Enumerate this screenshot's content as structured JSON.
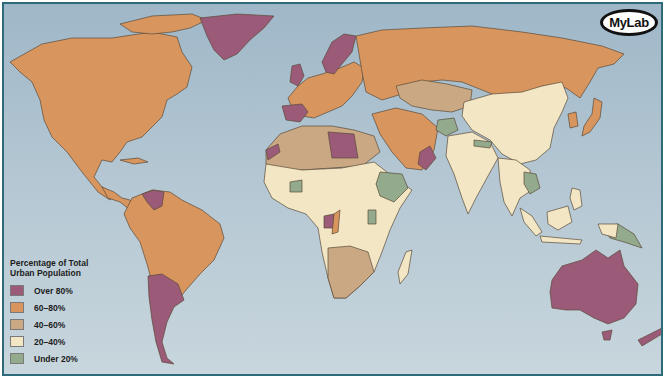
{
  "map": {
    "title": "Percentage of Total Urban Population",
    "logo_text": "MyLab",
    "colors": {
      "ocean": "#b0c4d0",
      "over_80": "#9a5a78",
      "from_60_to_80": "#d9955e",
      "from_40_to_60": "#c9a883",
      "from_20_to_40": "#f3e6c4",
      "under_20": "#93aa8c",
      "frame": "#2f6a78"
    },
    "legend": {
      "title_line1": "Percentage of Total",
      "title_line2": "Urban Population",
      "items": [
        {
          "label": "Over 80%",
          "color": "#9a5a78"
        },
        {
          "label": "60–80%",
          "color": "#d9955e"
        },
        {
          "label": "40–60%",
          "color": "#c9a883"
        },
        {
          "label": "20–40%",
          "color": "#f3e6c4"
        },
        {
          "label": "Under 20%",
          "color": "#93aa8c"
        }
      ]
    },
    "regions": [
      {
        "name": "North America",
        "category": "60–80%"
      },
      {
        "name": "Greenland",
        "category": "Over 80%"
      },
      {
        "name": "South America (most)",
        "category": "60–80%"
      },
      {
        "name": "Argentina / Chile / Uruguay",
        "category": "Over 80%"
      },
      {
        "name": "Venezuela",
        "category": "Over 80%"
      },
      {
        "name": "Russia",
        "category": "60–80%"
      },
      {
        "name": "Western Europe",
        "category": "60–80%"
      },
      {
        "name": "UK / Scandinavia / Spain / Benelux",
        "category": "Over 80%"
      },
      {
        "name": "Central Asia",
        "category": "40–60%"
      },
      {
        "name": "China",
        "category": "20–40%"
      },
      {
        "name": "South Asia",
        "category": "20–40%"
      },
      {
        "name": "Afghanistan / Nepal",
        "category": "Under 20%"
      },
      {
        "name": "Middle East",
        "category": "60–80%"
      },
      {
        "name": "Libya / Oman-UAE",
        "category": "Over 80%"
      },
      {
        "name": "North Africa",
        "category": "40–60%"
      },
      {
        "name": "Sub-Saharan Africa",
        "category": "20–40%"
      },
      {
        "name": "Ethiopia / Uganda / Burkina Faso",
        "category": "Under 20%"
      },
      {
        "name": "Southern Africa",
        "category": "40–60%"
      },
      {
        "name": "Southeast Asia",
        "category": "20–40%"
      },
      {
        "name": "Papua New Guinea / Vietnam",
        "category": "Under 20%"
      },
      {
        "name": "Japan / Korea",
        "category": "60–80%"
      },
      {
        "name": "Australia / New Zealand",
        "category": "Over 80%"
      }
    ]
  }
}
